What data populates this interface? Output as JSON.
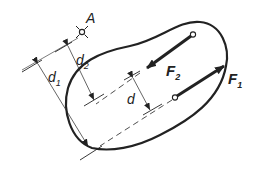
{
  "diagram": {
    "title": "",
    "point": {
      "label": "A"
    },
    "forces": [
      {
        "name": "F",
        "sub": "1"
      },
      {
        "name": "F",
        "sub": "2"
      }
    ],
    "dimensions": [
      {
        "name": "d",
        "sub": "1"
      },
      {
        "name": "d",
        "sub": "2"
      },
      {
        "name": "d",
        "sub": ""
      }
    ],
    "colors": {
      "ink": "#222222",
      "background": "#ffffff"
    }
  }
}
